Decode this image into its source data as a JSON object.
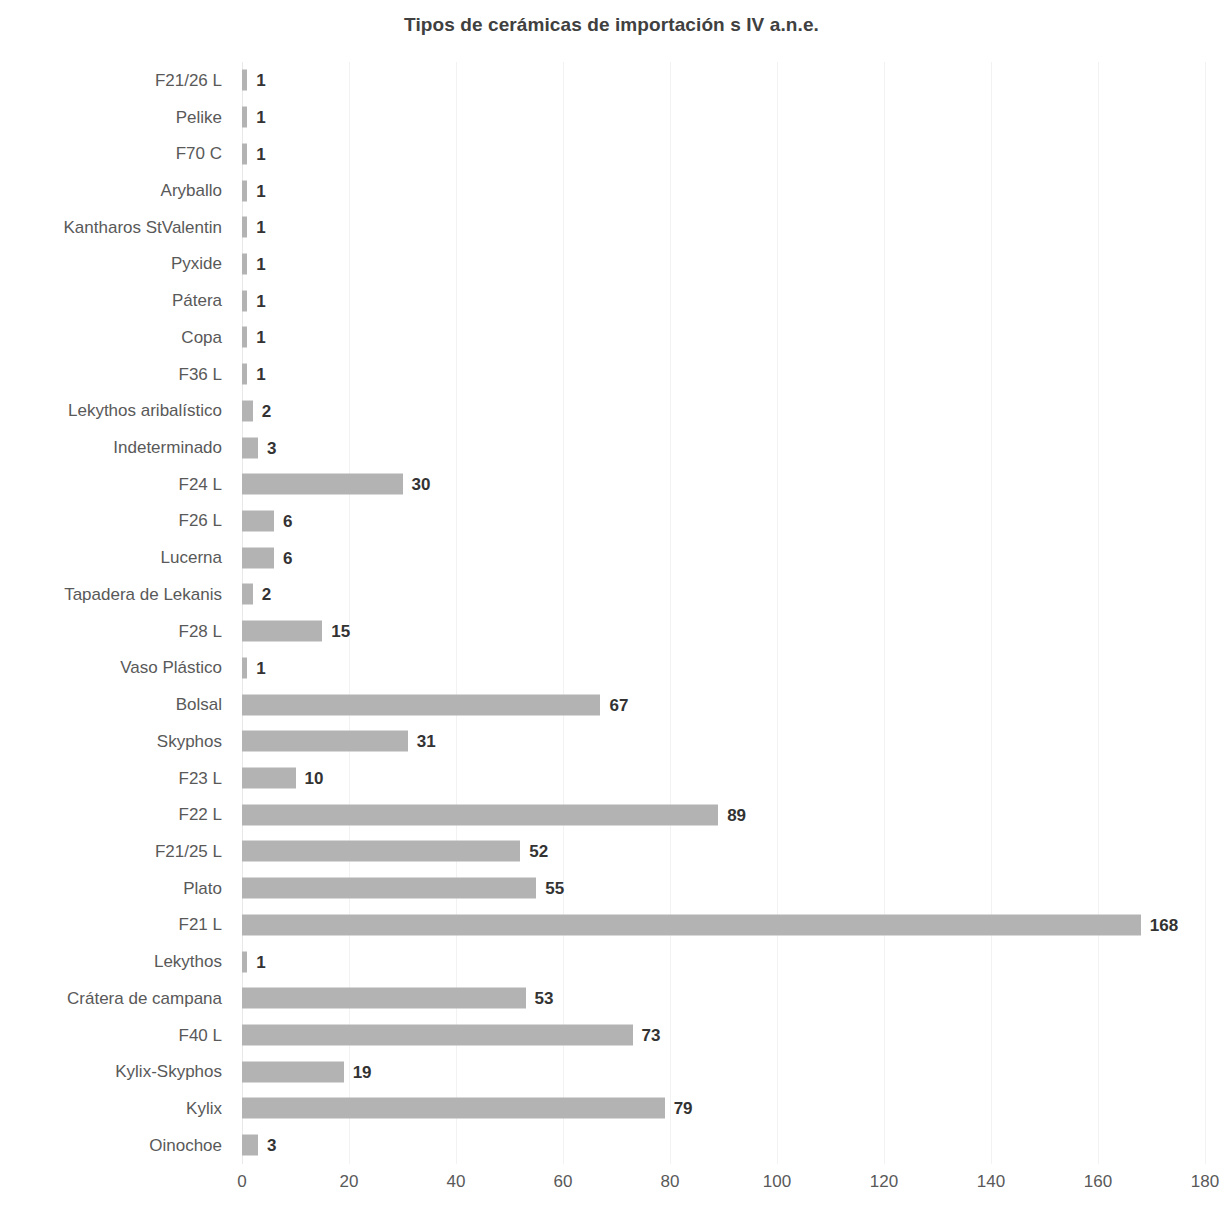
{
  "chart_data": {
    "type": "bar",
    "orientation": "horizontal",
    "title": "Tipos de cerámicas de importación s IV a.n.e.",
    "xlabel": "",
    "ylabel": "",
    "xlim": [
      0,
      180
    ],
    "xticks": [
      0,
      20,
      40,
      60,
      80,
      100,
      120,
      140,
      160,
      180
    ],
    "tick_labels": [
      "0",
      "20",
      "40",
      "60",
      "80",
      "100",
      "120",
      "140",
      "160",
      "180"
    ],
    "grid": true,
    "legend": "none",
    "bar_color": "#b3b3b3",
    "label_color": "#595959",
    "value_color": "#333333",
    "title_color": "#404040",
    "categories": [
      "F21/26 L",
      "Pelike",
      "F70 C",
      "Aryballo",
      "Kantharos StValentin",
      "Pyxide",
      "Pátera",
      "Copa",
      "F36 L",
      "Lekythos aribalístico",
      "Indeterminado",
      "F24 L",
      "F26 L",
      "Lucerna",
      "Tapadera de Lekanis",
      "F28 L",
      "Vaso Plástico",
      "Bolsal",
      "Skyphos",
      "F23 L",
      "F22 L",
      "F21/25 L",
      "Plato",
      "F21 L",
      "Lekythos",
      "Crátera de campana",
      "F40 L",
      "Kylix-Skyphos",
      "Kylix",
      "Oinochoe"
    ],
    "values": [
      1,
      1,
      1,
      1,
      1,
      1,
      1,
      1,
      1,
      2,
      3,
      30,
      6,
      6,
      2,
      15,
      1,
      67,
      31,
      10,
      89,
      52,
      55,
      168,
      1,
      53,
      73,
      19,
      79,
      3
    ],
    "value_labels": [
      "1",
      "1",
      "1",
      "1",
      "1",
      "1",
      "1",
      "1",
      "1",
      "2",
      "3",
      "30",
      "6",
      "6",
      "2",
      "15",
      "1",
      "67",
      "31",
      "10",
      "89",
      "52",
      "55",
      "168",
      "1",
      "53",
      "73",
      "19",
      "79",
      "3"
    ]
  }
}
